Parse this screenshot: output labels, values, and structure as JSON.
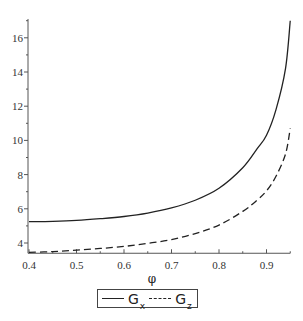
{
  "chart_data": {
    "type": "line",
    "title": "",
    "xlabel": "φ",
    "ylabel": "",
    "xlim": [
      0.4,
      0.95
    ],
    "ylim": [
      3.4,
      17.1
    ],
    "grid": false,
    "legend_position": "bottom",
    "x_ticks": [
      "0.4",
      "0.5",
      "0.6",
      "0.7",
      "0.8",
      "0.9"
    ],
    "y_ticks": [
      "4",
      "6",
      "8",
      "10",
      "12",
      "14",
      "16"
    ],
    "x": [
      0.4,
      0.45,
      0.5,
      0.55,
      0.6,
      0.65,
      0.7,
      0.75,
      0.8,
      0.85,
      0.88,
      0.9,
      0.92,
      0.94,
      0.95
    ],
    "series": [
      {
        "name": "Gx",
        "label_main": "G",
        "label_sub": "x",
        "style": "solid",
        "color": "#222222",
        "values": [
          5.25,
          5.27,
          5.32,
          5.42,
          5.55,
          5.75,
          6.05,
          6.5,
          7.2,
          8.4,
          9.5,
          10.3,
          11.8,
          14.2,
          17.0
        ]
      },
      {
        "name": "Gz",
        "label_main": "G",
        "label_sub": "z",
        "style": "dashed",
        "color": "#222222",
        "values": [
          3.45,
          3.5,
          3.58,
          3.68,
          3.8,
          3.98,
          4.2,
          4.55,
          5.05,
          5.85,
          6.5,
          7.05,
          7.9,
          9.2,
          10.7
        ]
      }
    ]
  }
}
